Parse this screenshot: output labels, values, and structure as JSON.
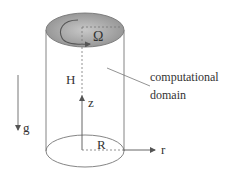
{
  "diagram": {
    "labels": {
      "omega": "Ω",
      "height": "H",
      "z_axis": "z",
      "gravity": "g",
      "radius": "R",
      "r_axis": "r",
      "domain_line1": "computational",
      "domain_line2": "domain"
    },
    "colors": {
      "stroke": "#666666",
      "top_fill": "#a8a8a8",
      "text": "#333333"
    }
  }
}
